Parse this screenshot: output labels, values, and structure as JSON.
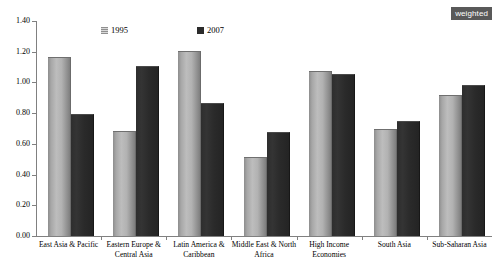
{
  "badge": {
    "label": "weighted"
  },
  "legend": {
    "items": [
      {
        "label": "1995",
        "swatch": "light-hatched-square-icon",
        "color": "#b0b0b0"
      },
      {
        "label": "2007",
        "swatch": "dark-square-icon",
        "color": "#2b2b2b"
      }
    ]
  },
  "axis": {
    "y_ticks": [
      "0.00",
      "0.20",
      "0.40",
      "0.60",
      "0.80",
      "1.00",
      "1.20",
      "1.40"
    ]
  },
  "chart_data": {
    "type": "bar",
    "title": "",
    "subtitle": "",
    "xlabel": "",
    "ylabel": "",
    "ylim": [
      0.0,
      1.4
    ],
    "ytick_step": 0.2,
    "grid": false,
    "legend_position": "top-center",
    "annotations": [
      "weighted"
    ],
    "categories": [
      "East Asia & Pacific",
      "Eastern Europe &\nCentral Asia",
      "Latin America &\nCaribbean",
      "Middle East & North\nAfrica",
      "High Income\nEconomies",
      "South Asia",
      "Sub-Saharan Asia"
    ],
    "series": [
      {
        "name": "1995",
        "color": "#b0b0b0",
        "values": [
          1.16,
          0.68,
          1.2,
          0.51,
          1.07,
          0.69,
          0.91
        ]
      },
      {
        "name": "2007",
        "color": "#2b2b2b",
        "values": [
          0.79,
          1.1,
          0.86,
          0.67,
          1.05,
          0.74,
          0.98
        ]
      }
    ]
  }
}
